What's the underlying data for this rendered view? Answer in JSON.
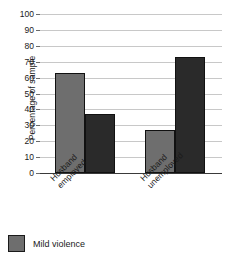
{
  "chart_data": {
    "type": "bar",
    "title": "",
    "subtitle": "",
    "xlabel": "",
    "ylabel": "Percentage of sample",
    "ylim": [
      0,
      100
    ],
    "yticks": [
      0,
      10,
      20,
      30,
      40,
      50,
      60,
      70,
      80,
      90,
      100
    ],
    "ytick_labels": [
      "0",
      "10",
      "20",
      "30",
      "40",
      "50",
      "60",
      "70",
      "80",
      "90",
      "100"
    ],
    "grid": true,
    "legend_position": "below-left",
    "categories": [
      "Husband employed",
      "Husband unemployed"
    ],
    "category_lines": [
      [
        "Husband",
        "employed"
      ],
      [
        "Husband",
        "unemployed"
      ]
    ],
    "series": [
      {
        "name": "Mild violence",
        "color": "#6e6e6e",
        "in_legend": true,
        "values": [
          63,
          27
        ]
      },
      {
        "name": "",
        "color": "#2a2a2a",
        "in_legend": false,
        "values": [
          37,
          73
        ]
      }
    ],
    "bars": [
      {
        "group": "Husband employed",
        "series": "Mild violence",
        "value": 63,
        "color": "#6e6e6e"
      },
      {
        "group": "Husband employed",
        "series": "",
        "value": 37,
        "color": "#2a2a2a"
      },
      {
        "group": "Husband unemployed",
        "series": "Mild violence",
        "value": 27,
        "color": "#6e6e6e"
      },
      {
        "group": "Husband unemployed",
        "series": "",
        "value": 73,
        "color": "#2a2a2a"
      }
    ],
    "colors": {
      "light_bar": "#6e6e6e",
      "dark_bar": "#2a2a2a",
      "gridline": "#c8c8c8",
      "axis": "#3a3a3a",
      "text": "#1a1a1a",
      "background": "#ffffff"
    }
  },
  "legend": {
    "items": [
      {
        "label": "Mild violence",
        "color": "#6e6e6e"
      }
    ]
  }
}
